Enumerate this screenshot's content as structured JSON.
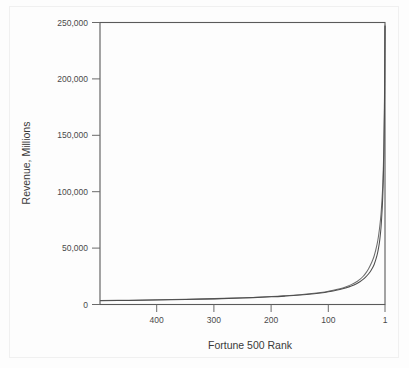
{
  "chart_data": {
    "type": "line",
    "title": "",
    "xlabel": "Fortune 500 Rank",
    "ylabel": "Revenue, Millions",
    "xlim": [
      500,
      1
    ],
    "ylim": [
      0,
      250000
    ],
    "x_reversed": true,
    "grid": false,
    "legend": "none",
    "xticks": [
      400,
      300,
      200,
      100,
      1
    ],
    "xtick_labels": [
      "400",
      "300",
      "200",
      "100",
      "1"
    ],
    "yticks": [
      0,
      50000,
      100000,
      150000,
      200000,
      250000
    ],
    "ytick_labels": [
      "0",
      "50,000",
      "100,000",
      "150,000",
      "200,000",
      "250,000"
    ],
    "x": [
      500,
      450,
      400,
      350,
      300,
      250,
      200,
      175,
      150,
      125,
      110,
      100,
      90,
      80,
      70,
      60,
      50,
      45,
      40,
      35,
      30,
      25,
      20,
      15,
      12,
      10,
      8,
      6,
      5,
      4,
      3,
      2,
      1
    ],
    "series": [
      {
        "name": "Revenue curve A",
        "color": "#4e4e4e",
        "values": [
          3300,
          3600,
          3950,
          4400,
          5000,
          5750,
          6800,
          7500,
          8400,
          9600,
          10500,
          11300,
          12200,
          13300,
          14700,
          16400,
          18700,
          20200,
          22000,
          24200,
          27000,
          30600,
          35500,
          43500,
          51000,
          58000,
          68000,
          84000,
          95000,
          110000,
          132000,
          170000,
          247000
        ]
      },
      {
        "name": "Revenue curve B",
        "color": "#6d6d6d",
        "values": [
          3500,
          3800,
          4150,
          4600,
          5200,
          5950,
          7000,
          7750,
          8700,
          9950,
          10900,
          11800,
          12800,
          14000,
          15600,
          17600,
          20400,
          22300,
          24600,
          27600,
          31500,
          36500,
          43000,
          53000,
          62000,
          70000,
          80000,
          95000,
          105000,
          120000,
          140000,
          175000,
          248000
        ]
      }
    ]
  },
  "axes": {
    "y_title": "Revenue, Millions",
    "x_title": "Fortune 500 Rank"
  }
}
